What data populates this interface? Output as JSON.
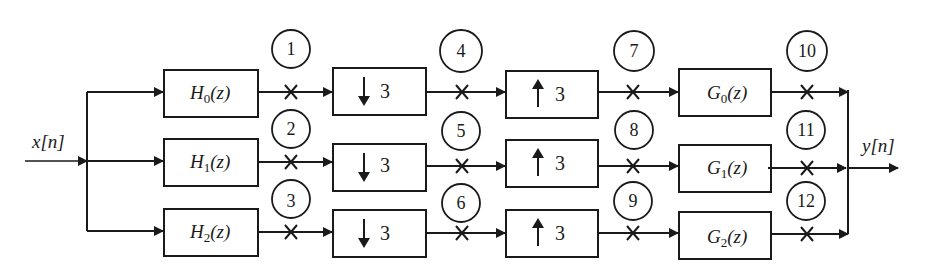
{
  "diagram": {
    "type": "three-channel maximally decimated filter bank",
    "input_label": "x[n]",
    "output_label": "y[n]",
    "analysis_filters": [
      "H0(z)",
      "H1(z)",
      "H2(z)"
    ],
    "analysis_filter_parts": [
      {
        "name": "H",
        "sub": "0",
        "arg": "(z)"
      },
      {
        "name": "H",
        "sub": "1",
        "arg": "(z)"
      },
      {
        "name": "H",
        "sub": "2",
        "arg": "(z)"
      }
    ],
    "downsamplers": [
      {
        "arrow": "↓",
        "factor": "3"
      },
      {
        "arrow": "↓",
        "factor": "3"
      },
      {
        "arrow": "↓",
        "factor": "3"
      }
    ],
    "upsamplers": [
      {
        "arrow": "↑",
        "factor": "3"
      },
      {
        "arrow": "↑",
        "factor": "3"
      },
      {
        "arrow": "↑",
        "factor": "3"
      }
    ],
    "synthesis_filters": [
      "G0(z)",
      "G1(z)",
      "G2(z)"
    ],
    "synthesis_filter_parts": [
      {
        "name": "G",
        "sub": "0",
        "arg": "(z)"
      },
      {
        "name": "G",
        "sub": "1",
        "arg": "(z)"
      },
      {
        "name": "G",
        "sub": "2",
        "arg": "(z)"
      }
    ],
    "probe_points": [
      "1",
      "2",
      "3",
      "4",
      "5",
      "6",
      "7",
      "8",
      "9",
      "10",
      "11",
      "12"
    ]
  }
}
